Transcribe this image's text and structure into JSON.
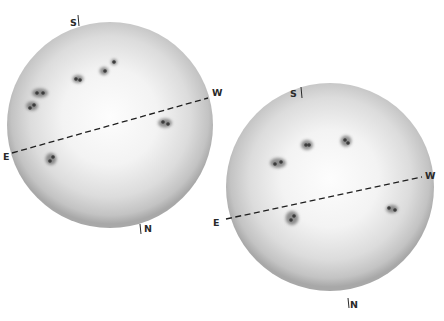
{
  "figure": {
    "colors": {
      "background": "#ffffff",
      "disk_center": "#fbfbfb",
      "disk_mid": "#e6e6e6",
      "disk_limb": "#a9a9a9",
      "sunspot": "#3c3c3c",
      "equator_line": "#1e1e1e",
      "label_text": "#2a2a2a"
    }
  },
  "disks": [
    {
      "id": "disk-1",
      "center": [
        110,
        125
      ],
      "radius": 103,
      "labels": {
        "south": "S",
        "north": "N",
        "east": "E",
        "west": "W"
      },
      "label_positions": {
        "south": [
          70,
          26
        ],
        "north": [
          144,
          232
        ],
        "east": [
          3,
          160
        ],
        "west": [
          212,
          96
        ]
      },
      "tick_positions": {
        "south": [
          [
            78,
            15
          ],
          [
            79,
            26
          ]
        ],
        "north": [
          [
            140,
            224
          ],
          [
            141,
            234
          ]
        ]
      },
      "equator": {
        "from": [
          12,
          153
        ],
        "to": [
          208,
          98
        ]
      },
      "sunspots": [
        {
          "x": 40,
          "y": 93,
          "rx": 8,
          "ry": 4.5,
          "cores": [
            [
              37,
              93
            ],
            [
              43,
              93
            ]
          ]
        },
        {
          "x": 32,
          "y": 106,
          "rx": 6,
          "ry": 4.5,
          "cores": [
            [
              30,
              108
            ],
            [
              34,
              105
            ]
          ]
        },
        {
          "x": 78,
          "y": 79,
          "rx": 5.5,
          "ry": 4,
          "cores": [
            [
              76,
              79
            ],
            [
              80,
              80
            ]
          ]
        },
        {
          "x": 104,
          "y": 71,
          "rx": 4.5,
          "ry": 4,
          "cores": [
            [
              105,
              71
            ]
          ]
        },
        {
          "x": 114,
          "y": 62,
          "rx": 3,
          "ry": 3,
          "cores": [
            [
              114,
              62
            ]
          ]
        },
        {
          "x": 165,
          "y": 123,
          "rx": 7,
          "ry": 4.5,
          "cores": [
            [
              163,
              122
            ],
            [
              168,
              124
            ]
          ]
        },
        {
          "x": 51,
          "y": 159,
          "rx": 5.5,
          "ry": 6,
          "cores": [
            [
              50,
              161
            ],
            [
              53,
              157
            ]
          ]
        }
      ]
    },
    {
      "id": "disk-2",
      "center": [
        330,
        187
      ],
      "radius": 104,
      "labels": {
        "south": "S",
        "north": "N",
        "east": "E",
        "west": "W"
      },
      "label_positions": {
        "south": [
          290,
          97
        ],
        "north": [
          350,
          308
        ],
        "east": [
          213,
          226
        ],
        "west": [
          425,
          179
        ]
      },
      "tick_positions": {
        "south": [
          [
            301,
            87
          ],
          [
            302,
            98
          ]
        ],
        "north": [
          [
            348,
            298
          ],
          [
            349,
            308
          ]
        ]
      },
      "equator": {
        "from": [
          226,
          219
        ],
        "to": [
          422,
          177
        ]
      },
      "sunspots": [
        {
          "x": 278,
          "y": 163,
          "rx": 8,
          "ry": 5,
          "cores": [
            [
              275,
              164
            ],
            [
              281,
              162
            ]
          ]
        },
        {
          "x": 307,
          "y": 145,
          "rx": 6,
          "ry": 5,
          "cores": [
            [
              306,
              145
            ],
            [
              309,
              145
            ]
          ]
        },
        {
          "x": 346,
          "y": 141,
          "rx": 5.5,
          "ry": 5.5,
          "cores": [
            [
              345,
              140
            ],
            [
              348,
              143
            ]
          ]
        },
        {
          "x": 292,
          "y": 218,
          "rx": 6.5,
          "ry": 7,
          "cores": [
            [
              291,
              220
            ],
            [
              294,
              216
            ]
          ]
        },
        {
          "x": 392,
          "y": 209,
          "rx": 6,
          "ry": 4,
          "cores": [
            [
              389,
              208
            ],
            [
              395,
              210
            ]
          ]
        }
      ]
    }
  ]
}
